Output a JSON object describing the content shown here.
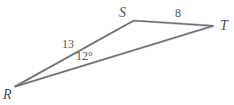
{
  "figure": {
    "background_color": "#ffffff",
    "stroke_color": "#6b6b72",
    "text_color": "#55555c",
    "width": 234,
    "height": 105
  },
  "vertices": {
    "R": {
      "label": "R",
      "x": 15,
      "y": 87
    },
    "S": {
      "label": "S",
      "x": 134,
      "y": 21
    },
    "T": {
      "label": "T",
      "x": 213,
      "y": 26
    }
  },
  "sides": {
    "RS": {
      "label": "13",
      "from": "R",
      "to": "S"
    },
    "ST": {
      "label": "8",
      "from": "S",
      "to": "T"
    },
    "RT": {
      "label": "",
      "from": "R",
      "to": "T"
    }
  },
  "angles": {
    "R": {
      "label": "12°",
      "value": 12,
      "unit": "degrees",
      "at": "R"
    }
  },
  "artifact": {
    "top_clipped_text": "·· ····· ··"
  }
}
